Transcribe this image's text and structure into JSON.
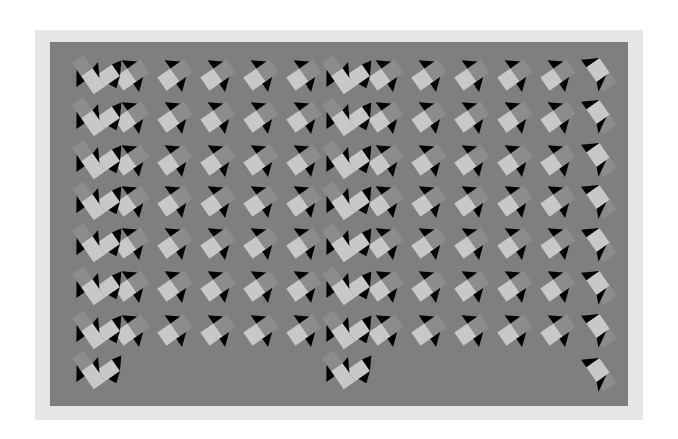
{
  "illusion": {
    "title": "",
    "frame_color": "#e6e6e6",
    "panel_color": "#7f7f7f",
    "light_color": "#c8c8c8",
    "mid_color": "#8c8c8c",
    "dark_color": "#000000",
    "rows_y": [
      75,
      117,
      160,
      201,
      243,
      286,
      330
    ],
    "row_unit_x": [
      132,
      175,
      218,
      261,
      304,
      386,
      429,
      472,
      515,
      558
    ],
    "vertical_columns_x": [
      90,
      340
    ],
    "right_column_x": 598,
    "right_column_y": [
      70,
      112,
      155,
      197,
      240,
      283,
      326,
      370
    ]
  }
}
